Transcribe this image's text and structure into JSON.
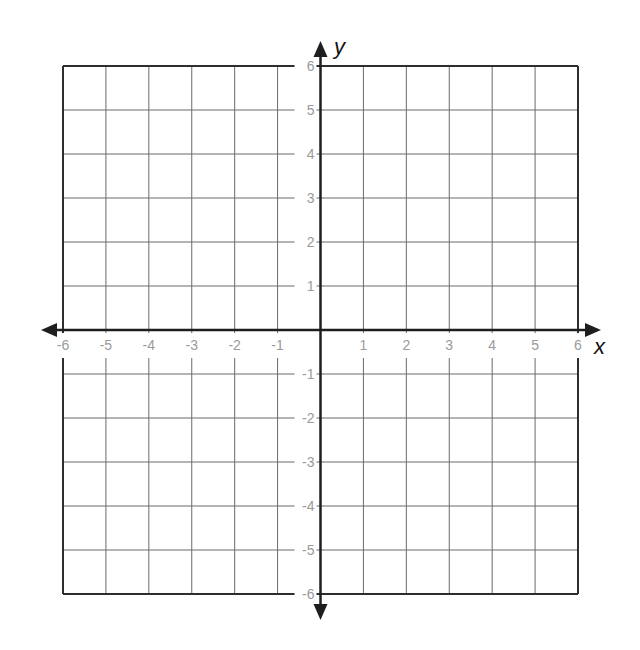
{
  "diagram": {
    "type": "coordinate-plane",
    "axes": {
      "x": {
        "label": "x",
        "min": -6,
        "max": 6,
        "step": 1
      },
      "y": {
        "label": "y",
        "min": -6,
        "max": 6,
        "step": 1
      }
    },
    "x_tick_labels": [
      "-6",
      "-5",
      "-4",
      "-3",
      "-2",
      "-1",
      "1",
      "2",
      "3",
      "4",
      "5",
      "6"
    ],
    "y_tick_labels": [
      "6",
      "5",
      "4",
      "3",
      "2",
      "1",
      "-1",
      "-2",
      "-3",
      "-4",
      "-5",
      "-6"
    ],
    "grid": true,
    "colors": {
      "grid": "#6a6a6a",
      "axis": "#1e1e1e",
      "border": "#2e2e2e",
      "tick_label": "#9a9a9a",
      "background": "#ffffff"
    }
  }
}
